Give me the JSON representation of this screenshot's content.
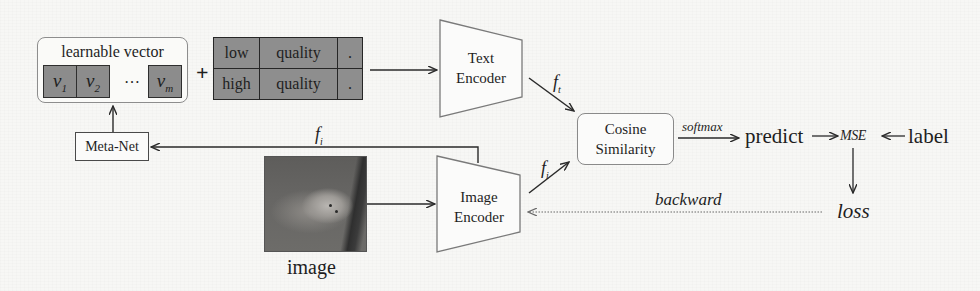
{
  "learnable_vector": {
    "title": "learnable vector",
    "cells": [
      {
        "base": "v",
        "sub": "1"
      },
      {
        "base": "v",
        "sub": "2"
      },
      {
        "base": "v",
        "sub": "m"
      }
    ],
    "ellipsis": "…"
  },
  "plus_sign": "+",
  "prompt_table": {
    "rows": [
      [
        "low",
        "quality",
        "."
      ],
      [
        "high",
        "quality",
        "."
      ]
    ],
    "fill_color": "#8e8e8e"
  },
  "meta_net": {
    "label": "Meta-Net"
  },
  "text_encoder": {
    "line1": "Text",
    "line2": "Encoder"
  },
  "image_encoder": {
    "line1": "Image",
    "line2": "Encoder"
  },
  "cosine_similarity": {
    "line1": "Cosine",
    "line2": "Similarity"
  },
  "image_block": {
    "caption": "image"
  },
  "features": {
    "text_feature": {
      "base": "f",
      "sub": "t"
    },
    "image_feature": {
      "base": "f",
      "sub": "i"
    },
    "image_feature_to_meta": {
      "base": "f",
      "sub": "i"
    }
  },
  "flow": {
    "softmax_label": "softmax",
    "predict": "predict",
    "mse": "MSE",
    "label": "label",
    "loss": "loss",
    "backward_label": "backward",
    "arrow_right": "→",
    "arrow_left": "←"
  },
  "colors": {
    "background": "#f7f7f5",
    "cell_fill": "#8c8c8c",
    "stroke": "#2e2e2e",
    "rounded_border": "#8a8a8a"
  }
}
